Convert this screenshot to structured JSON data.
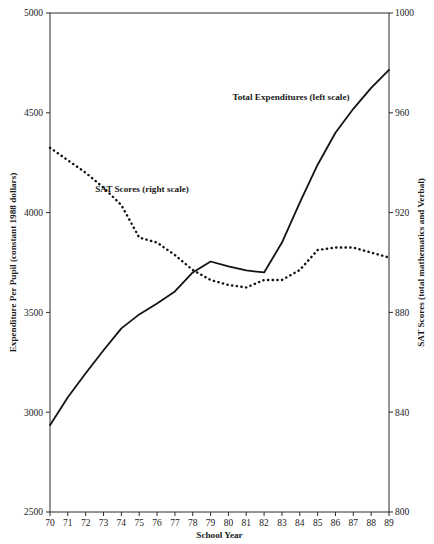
{
  "chart_data": {
    "type": "line",
    "title": "",
    "xlabel": "School Year",
    "ylabel": "Expenditure Per Pupil (constant 1988 dollars)",
    "y2label": "SAT Scores (total mathematics and Verbal)",
    "x": [
      70,
      71,
      72,
      73,
      74,
      75,
      76,
      77,
      78,
      79,
      80,
      81,
      82,
      83,
      84,
      85,
      86,
      87,
      88,
      89
    ],
    "xtick_labels": [
      "70",
      "71",
      "72",
      "73",
      "74",
      "75",
      "76",
      "77",
      "78",
      "79",
      "80",
      "81",
      "82",
      "83",
      "84",
      "85",
      "86",
      "87",
      "88",
      "89"
    ],
    "xlim": [
      70,
      89
    ],
    "ylim": [
      2500,
      5000
    ],
    "ytick_labels": [
      "5000",
      "4500",
      "4000",
      "3500",
      "3000",
      "2500"
    ],
    "ytick_values": [
      5000,
      4500,
      4000,
      3500,
      3000,
      2500
    ],
    "y2lim": [
      800,
      1000
    ],
    "y2tick_labels": [
      "1000",
      "960",
      "920",
      "880",
      "840",
      "800"
    ],
    "y2tick_values": [
      1000,
      960,
      920,
      880,
      840,
      800
    ],
    "grid": false,
    "legend_position": "inline-annotations",
    "series": [
      {
        "name": "Total Expenditures (left scale)",
        "axis": "left",
        "style": "solid",
        "values": [
          2935,
          3075,
          3195,
          3310,
          3420,
          3490,
          3545,
          3605,
          3700,
          3755,
          3730,
          3710,
          3700,
          3850,
          4050,
          4240,
          4400,
          4520,
          4625,
          4715
        ]
      },
      {
        "name": "SAT Scores (right scale)",
        "axis": "right",
        "style": "dotted",
        "values": [
          946,
          941,
          936,
          930,
          923,
          910,
          908,
          903,
          897,
          893,
          891,
          890,
          893,
          893,
          897,
          905,
          906,
          906,
          904,
          902
        ]
      }
    ],
    "annotations": [
      {
        "text": "Total Expenditures (left scale)",
        "x_px": 291,
        "y_px": 100
      },
      {
        "text": "SAT Scores (right scale)",
        "x_px": 142,
        "y_px": 192
      }
    ]
  },
  "axes": {
    "left_title": "Expenditure Per Pupil (constant 1988 dollars)",
    "right_title": "SAT Scores (total mathematics and Verbal)",
    "bottom_title": "School Year"
  },
  "colors": {
    "line": "#131313",
    "axis": "#2b2b2b",
    "background": "#ffffff"
  }
}
